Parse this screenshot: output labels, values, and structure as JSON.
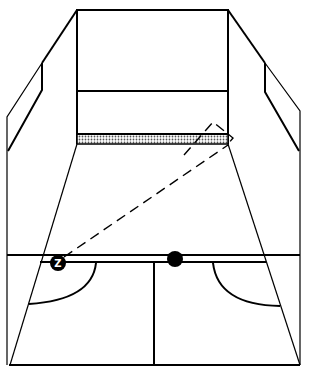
{
  "diagram": {
    "player": {
      "label": "Z",
      "x": 58,
      "y": 263
    },
    "ball": {
      "x": 175,
      "y": 259
    },
    "shot_path": {
      "style": "dashed",
      "from": [
        60,
        260
      ],
      "to_front_wall": [
        228,
        138
      ],
      "rebound_apex": [
        213,
        122
      ]
    },
    "elements": [
      "front-wall",
      "tin",
      "service-line",
      "side-walls",
      "short-line",
      "half-court-line",
      "service-boxes"
    ],
    "colors": {
      "line": "#000000",
      "background": "#ffffff",
      "tin_fill": "#bdbdbd"
    }
  }
}
